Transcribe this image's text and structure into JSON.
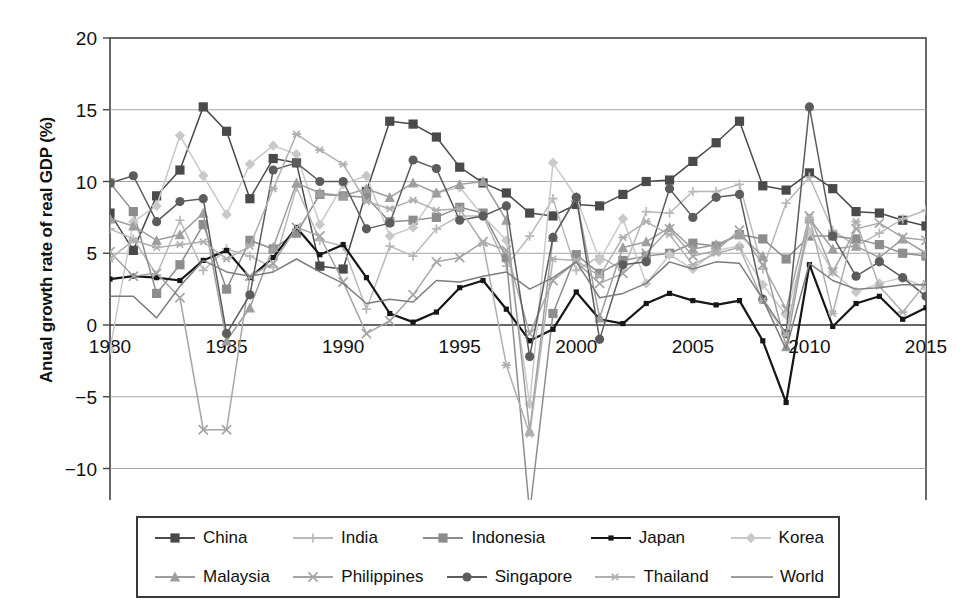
{
  "chart_data": {
    "type": "line",
    "title": "",
    "xlabel": "Year",
    "ylabel": "Anual growth rate of real GDP (%)",
    "xlim": [
      1980,
      2015
    ],
    "ylim": [
      -15,
      20
    ],
    "yticks": [
      20,
      15,
      10,
      5,
      0,
      -5,
      -10,
      -15
    ],
    "xticks": [
      1980,
      1985,
      1990,
      1995,
      2000,
      2005,
      2010,
      2015
    ],
    "grid": true,
    "legend_position": "bottom",
    "x": [
      1980,
      1981,
      1982,
      1983,
      1984,
      1985,
      1986,
      1987,
      1988,
      1989,
      1990,
      1991,
      1992,
      1993,
      1994,
      1995,
      1996,
      1997,
      1998,
      1999,
      2000,
      2001,
      2002,
      2003,
      2004,
      2005,
      2006,
      2007,
      2008,
      2009,
      2010,
      2011,
      2012,
      2013,
      2014,
      2015
    ],
    "series": [
      {
        "name": "China",
        "marker": "square",
        "color": "#4a4a4a",
        "values": [
          7.8,
          5.2,
          9.0,
          10.8,
          15.2,
          13.5,
          8.8,
          11.6,
          11.3,
          4.1,
          3.9,
          9.3,
          14.2,
          14.0,
          13.1,
          11.0,
          9.9,
          9.2,
          7.8,
          7.6,
          8.4,
          8.3,
          9.1,
          10.0,
          10.1,
          11.4,
          12.7,
          14.2,
          9.7,
          9.4,
          10.6,
          9.5,
          7.9,
          7.8,
          7.3,
          6.9
        ]
      },
      {
        "name": "India",
        "marker": "plus",
        "color": "#b9b9b9",
        "values": [
          6.7,
          6.0,
          3.5,
          7.3,
          3.8,
          5.3,
          4.8,
          4.0,
          9.6,
          5.9,
          5.5,
          1.1,
          5.5,
          4.8,
          6.7,
          7.6,
          7.6,
          4.1,
          6.2,
          8.8,
          3.8,
          4.8,
          3.8,
          7.9,
          7.8,
          9.3,
          9.3,
          9.8,
          3.9,
          8.5,
          10.3,
          6.6,
          5.5,
          6.4,
          7.4,
          8.0
        ]
      },
      {
        "name": "Indonesia",
        "marker": "square",
        "color": "#8d8d8d",
        "values": [
          9.9,
          7.9,
          2.2,
          4.2,
          7.0,
          2.5,
          5.9,
          5.3,
          6.4,
          9.1,
          9.0,
          8.9,
          7.2,
          7.3,
          7.5,
          8.2,
          7.8,
          4.7,
          -13.1,
          0.8,
          4.9,
          3.6,
          4.5,
          4.8,
          5.0,
          5.7,
          5.5,
          6.3,
          6.0,
          4.6,
          6.2,
          6.2,
          6.0,
          5.6,
          5.0,
          4.8
        ]
      },
      {
        "name": "Japan",
        "marker": "square-small",
        "color": "#161616",
        "values": [
          3.2,
          3.4,
          3.3,
          3.1,
          4.5,
          5.2,
          3.3,
          4.7,
          6.8,
          4.9,
          5.6,
          3.3,
          0.8,
          0.2,
          0.9,
          2.6,
          3.1,
          1.1,
          -1.1,
          -0.3,
          2.3,
          0.4,
          0.1,
          1.5,
          2.2,
          1.7,
          1.4,
          1.7,
          -1.1,
          -5.4,
          4.2,
          -0.1,
          1.5,
          2.0,
          0.4,
          1.2
        ]
      },
      {
        "name": "Korea",
        "marker": "diamond",
        "color": "#c9c9c9",
        "values": [
          -1.7,
          7.2,
          8.3,
          13.2,
          10.4,
          7.7,
          11.2,
          12.5,
          11.9,
          7.0,
          9.8,
          10.4,
          6.2,
          6.8,
          9.2,
          9.6,
          7.6,
          5.9,
          -5.5,
          11.3,
          8.9,
          4.5,
          7.4,
          2.9,
          4.9,
          3.9,
          5.2,
          5.5,
          2.8,
          0.7,
          6.5,
          3.7,
          2.3,
          2.9,
          3.3,
          2.6
        ]
      },
      {
        "name": "Malaysia",
        "marker": "triangle",
        "color": "#9e9e9e",
        "values": [
          7.4,
          6.9,
          5.9,
          6.3,
          7.8,
          -1.1,
          1.2,
          5.4,
          9.9,
          9.2,
          9.0,
          9.5,
          8.9,
          9.9,
          9.2,
          9.8,
          10.0,
          7.3,
          -7.4,
          6.1,
          8.9,
          0.5,
          5.4,
          5.8,
          6.8,
          5.3,
          5.6,
          6.3,
          4.8,
          -1.5,
          7.4,
          5.3,
          5.5,
          4.7,
          6.0,
          5.0
        ]
      },
      {
        "name": "Philippines",
        "marker": "x",
        "color": "#a5a5a5",
        "values": [
          5.1,
          3.4,
          3.6,
          1.9,
          -7.3,
          -7.3,
          3.4,
          4.3,
          6.8,
          6.2,
          3.0,
          -0.6,
          0.3,
          2.1,
          4.4,
          4.7,
          5.8,
          5.2,
          -0.6,
          3.1,
          4.4,
          2.9,
          3.6,
          5.0,
          6.7,
          4.8,
          5.2,
          6.6,
          4.2,
          1.1,
          7.6,
          3.7,
          6.7,
          7.1,
          6.1,
          5.9
        ]
      },
      {
        "name": "Singapore",
        "marker": "circle",
        "color": "#5c5c5c",
        "values": [
          9.9,
          10.4,
          7.2,
          8.6,
          8.8,
          -0.6,
          2.1,
          10.8,
          11.3,
          10.0,
          10.0,
          6.7,
          7.1,
          11.5,
          10.9,
          7.3,
          7.6,
          8.3,
          -2.2,
          6.1,
          8.9,
          -1.0,
          4.2,
          4.4,
          9.5,
          7.5,
          8.9,
          9.1,
          1.8,
          -0.6,
          15.2,
          6.2,
          3.4,
          4.4,
          3.3,
          2.0
        ]
      },
      {
        "name": "Thailand",
        "marker": "asterisk",
        "color": "#b0b0b0",
        "values": [
          4.6,
          5.9,
          5.4,
          5.6,
          5.8,
          4.6,
          5.5,
          9.5,
          13.3,
          12.2,
          11.2,
          8.6,
          8.1,
          8.7,
          8.0,
          8.1,
          5.7,
          -2.8,
          -7.6,
          4.6,
          4.5,
          3.4,
          6.1,
          7.2,
          6.3,
          4.2,
          5.0,
          5.4,
          1.7,
          -0.7,
          7.5,
          0.8,
          7.2,
          2.7,
          0.9,
          2.9
        ]
      },
      {
        "name": "World",
        "marker": "none",
        "color": "#7d7d7d",
        "values": [
          2.0,
          2.0,
          0.5,
          2.7,
          4.5,
          3.7,
          3.4,
          3.7,
          4.6,
          3.7,
          2.9,
          1.5,
          1.8,
          1.6,
          3.1,
          3.0,
          3.4,
          3.7,
          2.5,
          3.3,
          4.4,
          1.9,
          2.2,
          2.9,
          4.4,
          3.9,
          4.4,
          4.3,
          1.8,
          -1.7,
          4.3,
          3.1,
          2.5,
          2.6,
          2.8,
          2.8
        ]
      }
    ]
  },
  "axes": {
    "ytick_labels": [
      "20",
      "15",
      "10",
      "5",
      "0",
      "−5",
      "−10",
      "−15"
    ],
    "xtick_labels": [
      "1980",
      "1985",
      "1990",
      "1995",
      "2000",
      "2005",
      "2010",
      "2015"
    ]
  },
  "legend": {
    "row1": [
      {
        "label": "China",
        "marker": "square",
        "color": "#4a4a4a"
      },
      {
        "label": "India",
        "marker": "plus",
        "color": "#b9b9b9"
      },
      {
        "label": "Indonesia",
        "marker": "square",
        "color": "#8d8d8d"
      },
      {
        "label": "Japan",
        "marker": "square-small",
        "color": "#161616"
      },
      {
        "label": "Korea",
        "marker": "diamond",
        "color": "#c9c9c9"
      }
    ],
    "row2": [
      {
        "label": "Malaysia",
        "marker": "triangle",
        "color": "#9e9e9e"
      },
      {
        "label": "Philippines",
        "marker": "x",
        "color": "#a5a5a5"
      },
      {
        "label": "Singapore",
        "marker": "circle",
        "color": "#5c5c5c"
      },
      {
        "label": "Thailand",
        "marker": "asterisk",
        "color": "#b0b0b0"
      },
      {
        "label": "World",
        "marker": "none",
        "color": "#7d7d7d"
      }
    ]
  }
}
